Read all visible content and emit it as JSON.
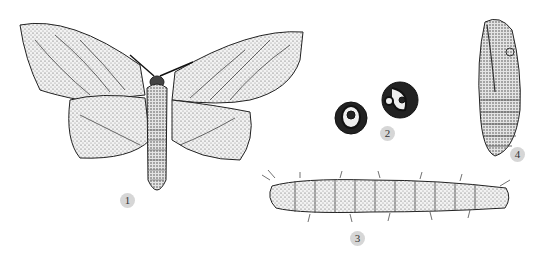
{
  "figure": {
    "panels": [
      {
        "id": "adult",
        "label": "1",
        "description": "adult moth, wings spread"
      },
      {
        "id": "eggs",
        "label": "2",
        "description": "two eggs"
      },
      {
        "id": "larva",
        "label": "3",
        "description": "larva / caterpillar"
      },
      {
        "id": "pupa",
        "label": "4",
        "description": "pupa"
      }
    ],
    "colors": {
      "background": "#ffffff",
      "ink": "#222222",
      "stipple": "#555555",
      "label_badge": "#d6d6d6"
    }
  }
}
